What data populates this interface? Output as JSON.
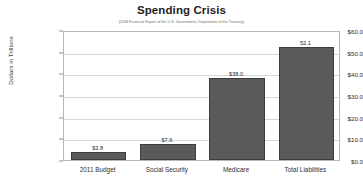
{
  "chart_data": {
    "type": "bar",
    "title": "Spending Crisis",
    "subtitle": "(2008 Financial Report of the U.S. Government, Department of the Treasury)",
    "categories": [
      "2011 Budget",
      "Social Security",
      "Medicare",
      "Total Liabilities"
    ],
    "values": [
      3.8,
      7.6,
      38.0,
      52.1
    ],
    "value_labels": [
      "$3.8",
      "$7.6",
      "$38.0",
      "52.1"
    ],
    "xlabel": "",
    "ylabel": "Dollars in Trillions",
    "ylim": [
      0,
      60
    ],
    "ytick_values": [
      0,
      10,
      20,
      30,
      40,
      50,
      60
    ],
    "ytick_labels": [
      "$0.0",
      "$10.0",
      "$20.0",
      "$30.0",
      "$40.0",
      "$50.0",
      "$60.0"
    ],
    "grid": "horizontal",
    "legend": "none",
    "bar_color": "#5a5a5a",
    "bar_border_color": "#3d3d3d",
    "gridline_color": "#d8d8d8",
    "plot_border_color": "#b7b7b7",
    "background_color": "#ffffff"
  }
}
